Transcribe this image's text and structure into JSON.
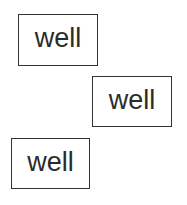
{
  "boxes": [
    {
      "label": "well"
    },
    {
      "label": "well"
    },
    {
      "label": "well"
    }
  ],
  "colors": {
    "border": "#333333",
    "text": "#2b2b2b",
    "background": "#ffffff"
  }
}
